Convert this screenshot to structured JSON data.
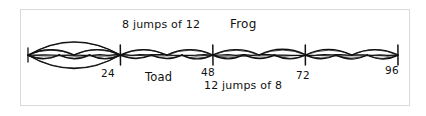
{
  "figure": {
    "kind": "hand-drawn-double-number-line",
    "background_color": "#ffffff",
    "ink_color": "#111111",
    "frame_color": "#d9d9d9"
  },
  "labels": {
    "top_jumps": "8 jumps of 12",
    "frog": "Frog",
    "toad": "Toad",
    "bottom_jumps": "12 jumps of 8"
  },
  "tick_labels": {
    "t24": "24",
    "t48": "48",
    "t72": "72",
    "t96": "96"
  },
  "chart_data": {
    "type": "line",
    "title": "",
    "subtitle": "",
    "xlabel": "",
    "ylabel": "",
    "xlim": [
      0,
      96
    ],
    "grid": false,
    "legend_position": "inline-annotations",
    "tick_values": [
      24,
      48,
      72,
      96
    ],
    "tick_text": [
      "24",
      "48",
      "72",
      "96"
    ],
    "annotations": [
      "8 jumps of 12",
      "Frog",
      "Toad",
      "12 jumps of 8"
    ],
    "series": [
      {
        "name": "Frog",
        "label": "8 jumps of 12",
        "side": "above",
        "jump_size": 12,
        "jump_count": 8,
        "values": [
          0,
          12,
          24,
          36,
          48,
          60,
          72,
          84,
          96
        ]
      },
      {
        "name": "Toad",
        "label": "12 jumps of 8",
        "side": "below",
        "jump_size": 8,
        "jump_count": 12,
        "values": [
          0,
          8,
          16,
          24,
          32,
          40,
          48,
          56,
          64,
          72,
          80,
          88,
          96
        ]
      }
    ],
    "highlight": {
      "name": "common-meeting-oval",
      "from": 0,
      "to": 24,
      "note": "large oval enclosing 0 to 24"
    }
  },
  "geometry": {
    "line_y": 55,
    "x_start": 28,
    "x_end": 398,
    "x_max_value": 96
  }
}
